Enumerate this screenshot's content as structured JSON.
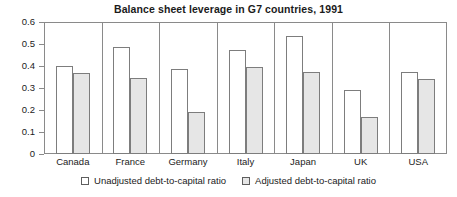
{
  "chart_data": {
    "type": "bar",
    "title": "Balance sheet leverage in G7 countries, 1991",
    "xlabel": "",
    "ylabel": "",
    "ylim": [
      0,
      0.6
    ],
    "yticks": [
      0,
      0.1,
      0.2,
      0.3,
      0.4,
      0.5,
      0.6
    ],
    "ytick_labels": [
      "0",
      "0.1",
      "0.2",
      "0.3",
      "0.4",
      "0.5",
      "0.6"
    ],
    "grid": false,
    "legend_position": "bottom-center",
    "categories": [
      "Canada",
      "France",
      "Germany",
      "Italy",
      "Japan",
      "UK",
      "USA"
    ],
    "series": [
      {
        "name": "Unadjusted debt-to-capital ratio",
        "color": "#ffffff",
        "edge_color": "#7d7d7d",
        "values": [
          0.4,
          0.485,
          0.385,
          0.475,
          0.535,
          0.29,
          0.375
        ]
      },
      {
        "name": "Adjusted debt-to-capital ratio",
        "color": "#e6e6e6",
        "edge_color": "#7d7d7d",
        "values": [
          0.37,
          0.345,
          0.19,
          0.395,
          0.375,
          0.17,
          0.34
        ]
      }
    ]
  },
  "legend": {
    "entries": [
      {
        "label": "Unadjusted debt-to-capital ratio"
      },
      {
        "label": "Adjusted debt-to-capital ratio"
      }
    ]
  },
  "colors": {
    "axis": "#8a8a8a",
    "text": "#1b1b1b",
    "unadjusted_fill": "#ffffff",
    "adjusted_fill": "#e6e6e6",
    "bar_edge": "#7d7d7d"
  }
}
